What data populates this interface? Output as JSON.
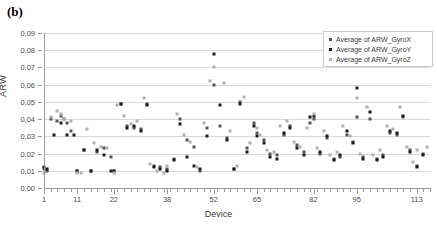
{
  "panel_label": "(b)",
  "chart_data": {
    "type": "scatter",
    "title": "",
    "xlabel": "Device",
    "ylabel": "ARW",
    "xlim": [
      1,
      117
    ],
    "ylim": [
      0.0,
      0.09
    ],
    "grid": true,
    "legend_position": "top-right",
    "y_ticks": [
      "0,00",
      "0,01",
      "0,02",
      "0,03",
      "0,04",
      "0,05",
      "0,06",
      "0,07",
      "0,08",
      "0,09"
    ],
    "y_tick_values": [
      0.0,
      0.01,
      0.02,
      0.03,
      0.04,
      0.05,
      0.06,
      0.07,
      0.08,
      0.09
    ],
    "x_ticks": [
      "1",
      "11",
      "22",
      "38",
      "52",
      "65",
      "82",
      "95",
      "113"
    ],
    "x_tick_values": [
      1,
      11,
      22,
      38,
      52,
      65,
      82,
      95,
      113
    ],
    "colors": {
      "GyroX": "#555555",
      "GyroY": "#1c1c1c",
      "GyroZ": "#b0b0b0"
    },
    "series": [
      {
        "name": "Average of ARW_GyroX",
        "color": "#555555",
        "x": [
          1,
          2,
          3,
          5,
          6,
          7,
          8,
          9,
          11,
          13,
          15,
          17,
          19,
          21,
          22,
          24,
          26,
          28,
          30,
          32,
          34,
          36,
          38,
          40,
          42,
          44,
          46,
          48,
          50,
          52,
          54,
          56,
          58,
          60,
          62,
          64,
          65,
          67,
          69,
          71,
          73,
          75,
          77,
          79,
          81,
          82,
          84,
          86,
          88,
          90,
          92,
          94,
          95,
          97,
          99,
          101,
          103,
          105,
          107,
          109,
          111,
          113,
          115
        ],
        "y": [
          0.011,
          0.01,
          0.04,
          0.039,
          0.042,
          0.04,
          0.038,
          0.033,
          0.01,
          0.022,
          0.01,
          0.021,
          0.023,
          0.018,
          0.01,
          0.049,
          0.036,
          0.035,
          0.034,
          0.049,
          0.013,
          0.012,
          0.011,
          0.017,
          0.04,
          0.028,
          0.024,
          0.01,
          0.035,
          0.06,
          0.036,
          0.029,
          0.011,
          0.05,
          0.023,
          0.038,
          0.032,
          0.028,
          0.02,
          0.019,
          0.031,
          0.036,
          0.025,
          0.021,
          0.038,
          0.04,
          0.02,
          0.029,
          0.017,
          0.018,
          0.031,
          0.027,
          0.041,
          0.018,
          0.04,
          0.017,
          0.019,
          0.032,
          0.031,
          0.041,
          0.022,
          0.013,
          0.02
        ]
      },
      {
        "name": "Average of ARW_GyroY",
        "color": "#1c1c1c",
        "x": [
          1,
          2,
          4,
          6,
          8,
          10,
          11,
          13,
          15,
          17,
          19,
          21,
          22,
          24,
          26,
          28,
          30,
          32,
          34,
          36,
          38,
          40,
          42,
          44,
          46,
          48,
          50,
          52,
          54,
          56,
          58,
          60,
          62,
          64,
          65,
          67,
          69,
          71,
          73,
          75,
          77,
          79,
          81,
          82,
          84,
          86,
          88,
          90,
          92,
          94,
          95,
          97,
          99,
          101,
          103,
          105,
          107,
          109,
          111,
          113,
          115
        ],
        "y": [
          0.012,
          0.011,
          0.031,
          0.038,
          0.031,
          0.031,
          0.01,
          0.022,
          0.01,
          0.022,
          0.019,
          0.01,
          0.01,
          0.049,
          0.035,
          0.036,
          0.033,
          0.048,
          0.012,
          0.011,
          0.01,
          0.016,
          0.037,
          0.018,
          0.013,
          0.011,
          0.03,
          0.078,
          0.048,
          0.028,
          0.011,
          0.049,
          0.021,
          0.036,
          0.03,
          0.026,
          0.018,
          0.017,
          0.032,
          0.035,
          0.023,
          0.019,
          0.041,
          0.042,
          0.021,
          0.03,
          0.016,
          0.019,
          0.033,
          0.026,
          0.058,
          0.017,
          0.044,
          0.016,
          0.018,
          0.033,
          0.032,
          0.042,
          0.021,
          0.012,
          0.019
        ]
      },
      {
        "name": "Average of ARW_GyroZ",
        "color": "#b0b0b0",
        "x": [
          1,
          3,
          5,
          6,
          7,
          9,
          11,
          12,
          14,
          16,
          18,
          20,
          22,
          23,
          25,
          27,
          29,
          31,
          33,
          35,
          37,
          38,
          41,
          43,
          45,
          47,
          49,
          51,
          52,
          55,
          57,
          59,
          61,
          63,
          65,
          66,
          68,
          70,
          72,
          74,
          76,
          78,
          80,
          82,
          83,
          85,
          87,
          89,
          91,
          93,
          95,
          96,
          98,
          100,
          102,
          104,
          106,
          108,
          110,
          112,
          113,
          116
        ],
        "y": [
          0.009,
          0.041,
          0.045,
          0.043,
          0.04,
          0.039,
          0.009,
          0.009,
          0.034,
          0.026,
          0.024,
          0.023,
          0.009,
          0.048,
          0.042,
          0.037,
          0.039,
          0.052,
          0.014,
          0.01,
          0.009,
          0.013,
          0.043,
          0.031,
          0.027,
          0.012,
          0.038,
          0.062,
          0.07,
          0.061,
          0.033,
          0.013,
          0.053,
          0.026,
          0.035,
          0.031,
          0.022,
          0.021,
          0.036,
          0.039,
          0.027,
          0.024,
          0.035,
          0.043,
          0.023,
          0.033,
          0.019,
          0.021,
          0.036,
          0.03,
          0.052,
          0.02,
          0.047,
          0.019,
          0.022,
          0.036,
          0.034,
          0.047,
          0.024,
          0.015,
          0.022,
          0.024
        ]
      }
    ]
  }
}
